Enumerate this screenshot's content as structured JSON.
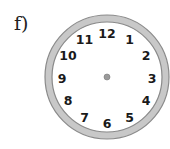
{
  "label": "f)",
  "clock": {
    "numbers": [
      "12",
      "1",
      "2",
      "3",
      "4",
      "5",
      "6",
      "7",
      "8",
      "9",
      "10",
      "11"
    ],
    "ring_color": "#c8c8c8",
    "ring_edge_color": "#8a8a8a",
    "center_dot_color": "#9a9a9a",
    "hands": "none"
  }
}
